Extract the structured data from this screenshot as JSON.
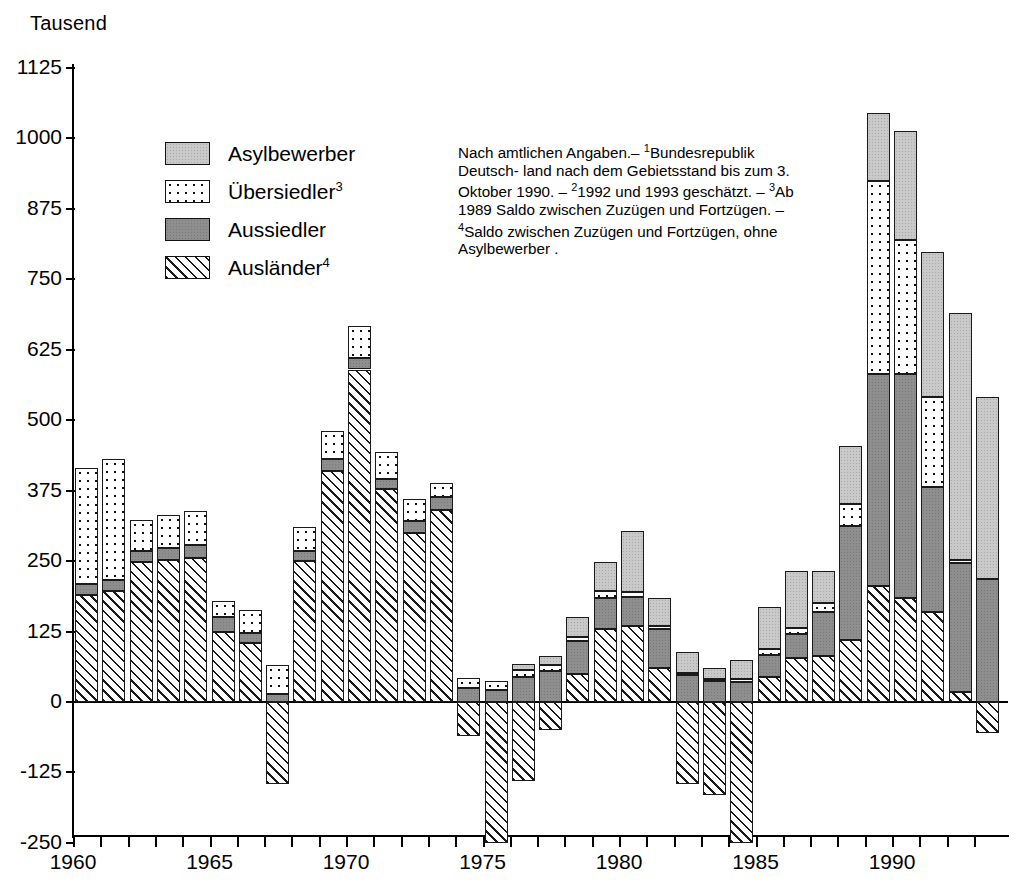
{
  "axis_unit_label": "Tausend",
  "legend": {
    "items": [
      {
        "label": "Asylbewerber",
        "sup": "",
        "key": "asyl",
        "color": "#c9c9c9"
      },
      {
        "label": "Übersiedler",
        "sup": "3",
        "key": "uber",
        "color": "#ffffff"
      },
      {
        "label": "Aussiedler",
        "sup": "",
        "key": "auss",
        "color": "#8e8e8e"
      },
      {
        "label": "Ausländer",
        "sup": "4",
        "key": "ausl",
        "color": "#ffffff"
      }
    ]
  },
  "note": {
    "line1": "Nach amtlichen Angaben.– ",
    "sup1": "1",
    "line1b": "Bundesrepublik Deutsch-",
    "line2": "land nach dem Gebietsstand bis zum 3. Oktober 1990. – ",
    "sup2": "2",
    "line2b": "1992 und 1993 geschätzt. – ",
    "sup3": "3",
    "line3": "Ab 1989 Saldo zwischen",
    "line4": "Zuzügen und Fortzügen. – ",
    "sup4": "4",
    "line4b": "Saldo zwischen Zuzügen",
    "line5": "und Fortzügen, ohne Asylbewerber ."
  },
  "chart_data": {
    "type": "bar",
    "subtype": "stacked-bar-with-negatives",
    "title": "",
    "xlabel": "",
    "ylabel": "Tausend",
    "ylim": [
      -250,
      1125
    ],
    "ytick_values": [
      -250,
      -125,
      0,
      125,
      250,
      375,
      500,
      625,
      750,
      875,
      1000,
      1125
    ],
    "ytick_labels": [
      "-250",
      "-125",
      "0",
      "125",
      "250",
      "375",
      "500",
      "625",
      "750",
      "875",
      "1000",
      "1125"
    ],
    "xtick_labels": [
      "1960",
      "1965",
      "1970",
      "1975",
      "1980",
      "1985",
      "1990"
    ],
    "xtick_years": [
      1960,
      1965,
      1970,
      1975,
      1980,
      1985,
      1990
    ],
    "grid": false,
    "legend_position": "upper-left-inside",
    "categories": [
      1960,
      1961,
      1962,
      1963,
      1964,
      1965,
      1966,
      1967,
      1968,
      1969,
      1970,
      1971,
      1972,
      1973,
      1974,
      1975,
      1976,
      1977,
      1978,
      1979,
      1980,
      1981,
      1982,
      1983,
      1984,
      1985,
      1986,
      1987,
      1988,
      1989,
      1990,
      1991,
      1992,
      1993
    ],
    "series": [
      {
        "name": "Ausländer",
        "key": "ausl",
        "values": [
          190,
          197,
          248,
          252,
          255,
          125,
          105,
          -145,
          250,
          410,
          590,
          378,
          300,
          340,
          -60,
          -250,
          -140,
          -50,
          50,
          130,
          135,
          60,
          -145,
          -165,
          -250,
          45,
          78,
          82,
          110,
          205,
          185,
          160,
          17,
          -55
        ]
      },
      {
        "name": "Aussiedler",
        "key": "auss",
        "values": [
          20,
          20,
          20,
          22,
          24,
          25,
          18,
          15,
          18,
          22,
          20,
          18,
          22,
          23,
          25,
          22,
          44,
          55,
          58,
          55,
          52,
          70,
          48,
          37,
          36,
          39,
          42,
          78,
          203,
          377,
          397,
          222,
          230,
          219
        ]
      },
      {
        "name": "Übersiedler",
        "key": "uber",
        "values": [
          205,
          215,
          55,
          57,
          60,
          30,
          40,
          50,
          42,
          48,
          58,
          48,
          38,
          25,
          18,
          15,
          12,
          10,
          8,
          12,
          8,
          5,
          4,
          3,
          4,
          10,
          12,
          16,
          39,
          343,
          238,
          160,
          5,
          0
        ]
      },
      {
        "name": "Asylbewerber",
        "key": "asyl",
        "values": [
          0,
          0,
          0,
          0,
          0,
          0,
          0,
          0,
          0,
          0,
          0,
          0,
          0,
          0,
          0,
          0,
          12,
          16,
          34,
          52,
          108,
          50,
          37,
          20,
          35,
          74,
          100,
          57,
          103,
          121,
          193,
          256,
          438,
          322
        ]
      }
    ],
    "series_order_bottom_to_top": [
      "Ausländer",
      "Aussiedler",
      "Übersiedler",
      "Asylbewerber"
    ]
  }
}
